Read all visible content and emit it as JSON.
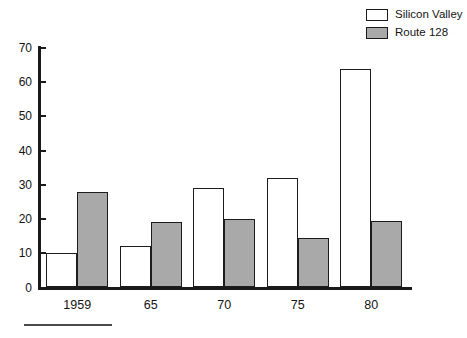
{
  "legend": {
    "position": "top-right",
    "entries": [
      {
        "label": "Silicon Valley",
        "swatch": "white-square-icon",
        "color": "#ffffff"
      },
      {
        "label": "Route 128",
        "swatch": "gray-square-icon",
        "color": "#a9a9a9"
      }
    ]
  },
  "axis": {
    "y_ticks": [
      "0",
      "10",
      "20",
      "30",
      "40",
      "50",
      "60",
      "70"
    ],
    "x_ticks": [
      "1959",
      "65",
      "70",
      "75",
      "80"
    ]
  },
  "chart_data": {
    "type": "bar",
    "title": "",
    "subtitle": "",
    "xlabel": "",
    "ylabel": "",
    "categories": [
      "1959",
      "65",
      "70",
      "75",
      "80"
    ],
    "series": [
      {
        "name": "Silicon Valley",
        "color": "#ffffff",
        "values": [
          10,
          12,
          29,
          32,
          64
        ]
      },
      {
        "name": "Route 128",
        "color": "#a9a9a9",
        "values": [
          28,
          19,
          20,
          14.5,
          19.5
        ]
      }
    ],
    "ylim": [
      0,
      70
    ],
    "ytick_step": 10,
    "grid": false,
    "legend_position": "top-right"
  }
}
